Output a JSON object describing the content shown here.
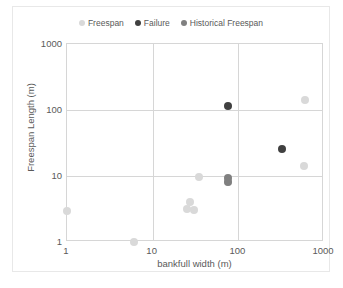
{
  "chart_data": {
    "type": "scatter",
    "title": "",
    "xlabel": "bankfull width (m)",
    "ylabel": "Freespan Length (m)",
    "xscale": "log",
    "yscale": "log",
    "xlim": [
      1,
      1000
    ],
    "ylim": [
      1,
      1000
    ],
    "xticks": [
      "1",
      "10",
      "100",
      "1000"
    ],
    "yticks": [
      "1",
      "10",
      "100",
      "1000"
    ],
    "grid": true,
    "legend_position": "top-center",
    "series": [
      {
        "name": "Freespan",
        "color": "#D9D9D9",
        "marker": "circle",
        "points": [
          {
            "x": 1,
            "y": 3
          },
          {
            "x": 6,
            "y": 1
          },
          {
            "x": 27,
            "y": 4
          },
          {
            "x": 25,
            "y": 3.2
          },
          {
            "x": 30,
            "y": 3.1
          },
          {
            "x": 35,
            "y": 9.8
          },
          {
            "x": 75,
            "y": 8
          },
          {
            "x": 600,
            "y": 140
          },
          {
            "x": 580,
            "y": 14
          }
        ]
      },
      {
        "name": "Failure",
        "color": "#404040",
        "marker": "circle",
        "points": [
          {
            "x": 75,
            "y": 115
          },
          {
            "x": 320,
            "y": 26
          }
        ]
      },
      {
        "name": "Historical Freespan",
        "color": "#808080",
        "marker": "circle",
        "points": [
          {
            "x": 75,
            "y": 9.2
          },
          {
            "x": 75,
            "y": 8.2
          }
        ]
      }
    ]
  },
  "legend": {
    "entries": [
      {
        "label": "Freespan",
        "color": "#D9D9D9"
      },
      {
        "label": "Failure",
        "color": "#404040"
      },
      {
        "label": "Historical Freespan",
        "color": "#808080"
      }
    ]
  },
  "axes": {
    "x": {
      "title": "bankfull width (m)",
      "ticks": [
        "1",
        "10",
        "100",
        "1000"
      ]
    },
    "y": {
      "title": "Freespan Length (m)",
      "ticks": [
        "1000",
        "100",
        "10",
        "1"
      ]
    }
  },
  "colors": {
    "freespan": "#D9D9D9",
    "failure": "#404040",
    "historical_freespan": "#808080",
    "grid": "#D6D6D6",
    "text": "#5A5A5A",
    "frame": "#E8E8E8"
  }
}
